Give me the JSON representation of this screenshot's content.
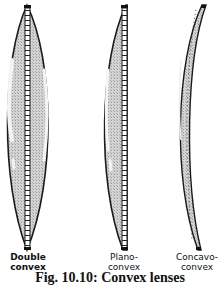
{
  "figure": {
    "labels": {
      "double_convex": [
        "Double",
        "convex"
      ],
      "plano_convex": [
        "Plano-",
        "convex"
      ],
      "concavo_convex": [
        "Concavo-",
        "convex"
      ]
    },
    "caption": "Fig. 10.10: Convex lenses"
  },
  "colors": {
    "outline": "#1a1a1a",
    "fill": "#c8c8c8",
    "highlight": "#f2f2f2",
    "background": "#ffffff"
  }
}
